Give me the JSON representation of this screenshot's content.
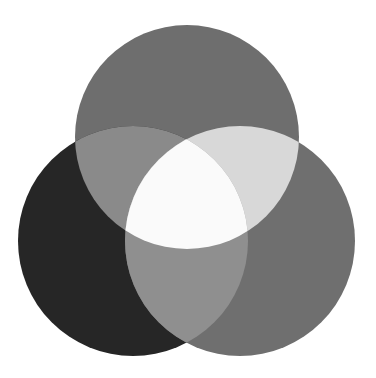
{
  "diagram": {
    "type": "three-set-venn",
    "background": "#ffffff",
    "circles": [
      {
        "id": "top",
        "cx": 187,
        "cy": 137,
        "r": 112,
        "fill": "#6e6e6e"
      },
      {
        "id": "left",
        "cx": 133,
        "cy": 241,
        "r": 115,
        "fill": "#262626"
      },
      {
        "id": "right",
        "cx": 240,
        "cy": 241,
        "r": 115,
        "fill": "#6f6f6f"
      }
    ],
    "regions": {
      "top_left": "#8a8a8a",
      "top_right": "#d8d8d8",
      "left_right": "#8f8f8f",
      "center": "#fafafa"
    }
  }
}
